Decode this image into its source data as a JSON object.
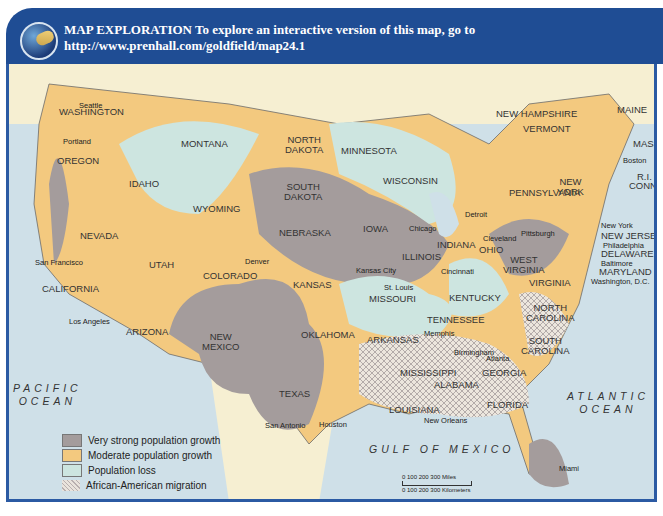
{
  "header": {
    "title_line1": "MAP EXPLORATION  To explore an interactive version of this map, go to",
    "title_line2": "http://www.prenhall.com/goldfield/map24.1",
    "logo_icon": "globe-icon"
  },
  "colors": {
    "header_bg": "#1f4d94",
    "frame_border": "#2b5aa3",
    "water": "#cfe0e8",
    "canada_mexico": "#f6efd2",
    "very_strong_growth": "#a49c9c",
    "moderate_growth": "#f3c97f",
    "population_loss": "#cde5e0",
    "migration": "#f3efe6"
  },
  "states": {
    "washington": "WASHINGTON",
    "oregon": "OREGON",
    "california": "CALIFORNIA",
    "nevada": "NEVADA",
    "idaho": "IDAHO",
    "montana": "MONTANA",
    "wyoming": "WYOMING",
    "utah": "UTAH",
    "arizona": "ARIZONA",
    "colorado": "COLORADO",
    "new_mexico": "NEW\nMEXICO",
    "north_dakota": "NORTH\nDAKOTA",
    "south_dakota": "SOUTH\nDAKOTA",
    "nebraska": "NEBRASKA",
    "kansas": "KANSAS",
    "oklahoma": "OKLAHOMA",
    "texas": "TEXAS",
    "minnesota": "MINNESOTA",
    "iowa": "IOWA",
    "missouri": "MISSOURI",
    "arkansas": "ARKANSAS",
    "louisiana": "LOUISIANA",
    "wisconsin": "WISCONSIN",
    "illinois": "ILLINOIS",
    "indiana": "INDIANA",
    "ohio": "OHIO",
    "kentucky": "KENTUCKY",
    "tennessee": "TENNESSEE",
    "mississippi": "MISSISSIPPI",
    "alabama": "ALABAMA",
    "georgia": "GEORGIA",
    "florida": "FLORIDA",
    "south_carolina": "SOUTH\nCAROLINA",
    "north_carolina": "NORTH\nCAROLINA",
    "virginia": "VIRGINIA",
    "west_virginia": "WEST\nVIRGINIA",
    "pennsylvania": "PENNSYLVANIA",
    "new_york": "NEW\nYORK",
    "maine": "MAINE",
    "new_hampshire": "NEW HAMPSHIRE",
    "vermont": "VERMONT",
    "mass": "MASS.",
    "ri": "R.I.",
    "conn": "CONN.",
    "new_jersey": "NEW JERSEY",
    "delaware": "DELAWARE",
    "maryland": "MARYLAND"
  },
  "cities": {
    "seattle": "Seattle",
    "portland": "Portland",
    "san_francisco": "San Francisco",
    "los_angeles": "Los Angeles",
    "denver": "Denver",
    "kansas_city": "Kansas City",
    "st_louis": "St. Louis",
    "chicago": "Chicago",
    "detroit": "Detroit",
    "cleveland": "Cleveland",
    "pittsburgh": "Pittsburgh",
    "cincinnati": "Cincinnati",
    "memphis": "Memphis",
    "birmingham": "Birmingham",
    "atlanta": "Atlanta",
    "new_orleans": "New Orleans",
    "houston": "Houston",
    "san_antonio": "San Antonio",
    "miami": "Miami",
    "boston": "Boston",
    "new_york_city": "New York",
    "philadelphia": "Philadelphia",
    "baltimore": "Baltimore",
    "washington_dc": "Washington, D.C."
  },
  "water_bodies": {
    "pacific": "PACIFIC\nOCEAN",
    "atlantic": "ATLANTIC\nOCEAN",
    "gulf": "GULF OF MEXICO"
  },
  "legend": {
    "items": [
      {
        "label": "Very strong population growth",
        "color": "#a49c9c"
      },
      {
        "label": "Moderate population growth",
        "color": "#f3c97f"
      },
      {
        "label": "Population loss",
        "color": "#cde5e0"
      },
      {
        "label": "African-American migration",
        "color": "#e9e3dc"
      }
    ]
  },
  "scale": {
    "miles_ticks": "0     100    200    300 Miles",
    "km_ticks": "0  100 200 300 Kilometers"
  }
}
